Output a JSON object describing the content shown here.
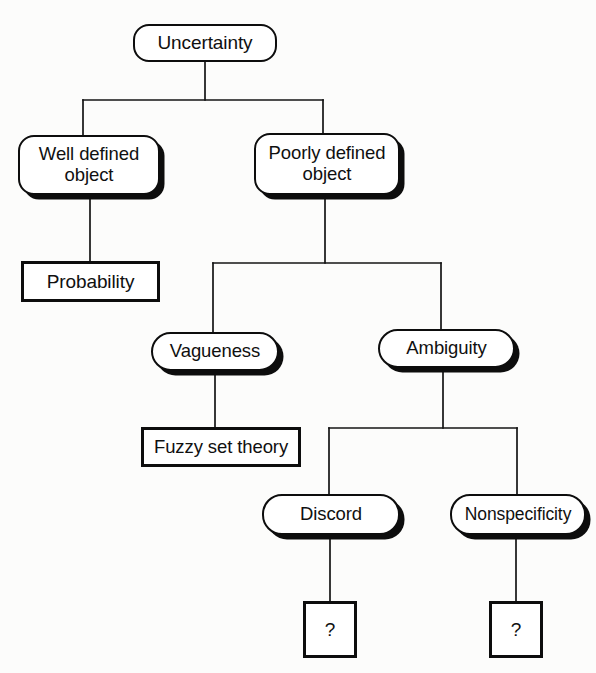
{
  "diagram": {
    "type": "tree",
    "background_color": "#fcfcfb",
    "stroke_color": "#0d0d0d",
    "node_fill_color": "#ffffff",
    "nodes": [
      {
        "id": "uncertainty",
        "label": "Uncertainty",
        "shape": "rounded-rectangle",
        "shadow": false,
        "x": 133,
        "y": 24,
        "w": 144,
        "h": 38
      },
      {
        "id": "well-defined-object",
        "label": "Well defined\nobject",
        "shape": "rounded-rectangle",
        "shadow": true,
        "x": 18,
        "y": 135,
        "w": 142,
        "h": 60
      },
      {
        "id": "poorly-defined-object",
        "label": "Poorly defined\nobject",
        "shape": "rounded-rectangle",
        "shadow": true,
        "x": 254,
        "y": 133,
        "w": 146,
        "h": 62
      },
      {
        "id": "probability",
        "label": "Probability",
        "shape": "rectangle",
        "shadow": false,
        "x": 21,
        "y": 261,
        "w": 139,
        "h": 41
      },
      {
        "id": "vagueness",
        "label": "Vagueness",
        "shape": "rounded-rectangle",
        "shadow": true,
        "x": 151,
        "y": 332,
        "w": 128,
        "h": 39
      },
      {
        "id": "ambiguity",
        "label": "Ambiguity",
        "shape": "rounded-rectangle",
        "shadow": true,
        "x": 378,
        "y": 329,
        "w": 137,
        "h": 39
      },
      {
        "id": "fuzzy-set-theory",
        "label": "Fuzzy set theory",
        "shape": "rectangle",
        "shadow": false,
        "x": 141,
        "y": 427,
        "w": 160,
        "h": 40
      },
      {
        "id": "discord",
        "label": "Discord",
        "shape": "rounded-rectangle",
        "shadow": true,
        "x": 262,
        "y": 494,
        "w": 138,
        "h": 41
      },
      {
        "id": "nonspecificity",
        "label": "Nonspecificity",
        "shape": "rounded-rectangle",
        "shadow": true,
        "x": 450,
        "y": 494,
        "w": 136,
        "h": 41
      },
      {
        "id": "discord-question",
        "label": "?",
        "shape": "rectangle",
        "shadow": false,
        "x": 303,
        "y": 601,
        "w": 54,
        "h": 57
      },
      {
        "id": "nonspecificity-question",
        "label": "?",
        "shape": "rectangle",
        "shadow": false,
        "x": 489,
        "y": 601,
        "w": 54,
        "h": 57
      }
    ],
    "edges": [
      {
        "from": "uncertainty",
        "to": "well-defined-object",
        "style": "orthogonal"
      },
      {
        "from": "uncertainty",
        "to": "poorly-defined-object",
        "style": "orthogonal"
      },
      {
        "from": "well-defined-object",
        "to": "probability",
        "style": "straight"
      },
      {
        "from": "poorly-defined-object",
        "to": "vagueness",
        "style": "orthogonal"
      },
      {
        "from": "poorly-defined-object",
        "to": "ambiguity",
        "style": "orthogonal"
      },
      {
        "from": "vagueness",
        "to": "fuzzy-set-theory",
        "style": "straight"
      },
      {
        "from": "ambiguity",
        "to": "discord",
        "style": "orthogonal"
      },
      {
        "from": "ambiguity",
        "to": "nonspecificity",
        "style": "orthogonal"
      }
    ]
  }
}
